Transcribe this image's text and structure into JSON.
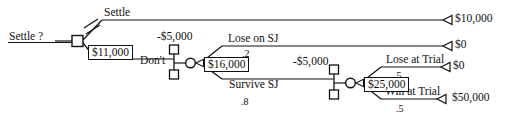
{
  "diagram": {
    "type": "decision-tree",
    "width": 513,
    "height": 127,
    "stroke_color": "#111111",
    "background_color": "#ffffff"
  },
  "root": {
    "label": "Settle ?"
  },
  "branch_labels": {
    "settle": "Settle",
    "dont": "Don't",
    "lose_on_sj": "Lose on SJ",
    "survive_sj": "Survive SJ",
    "lose_at_trial": "Lose at Trial",
    "win_at_trial": "Win at Trial"
  },
  "probabilities": {
    "lose_on_sj": ".2",
    "survive_sj": ".8",
    "lose_at_trial": ".5",
    "win_at_trial": ".5"
  },
  "costs": {
    "sj_stage": "-$5,000",
    "trial_stage": "-$5,000"
  },
  "rollback_values": {
    "root_decision": "$11,000",
    "sj_chance": "$16,000",
    "trial_chance": "$25,000"
  },
  "payoffs": {
    "settle": "$10,000",
    "lose_on_sj": "$0",
    "lose_at_trial": "$0",
    "win_at_trial": "$50,000"
  },
  "markers": {
    "pruned_branch": "double-slash",
    "pruned_on": "settle"
  }
}
